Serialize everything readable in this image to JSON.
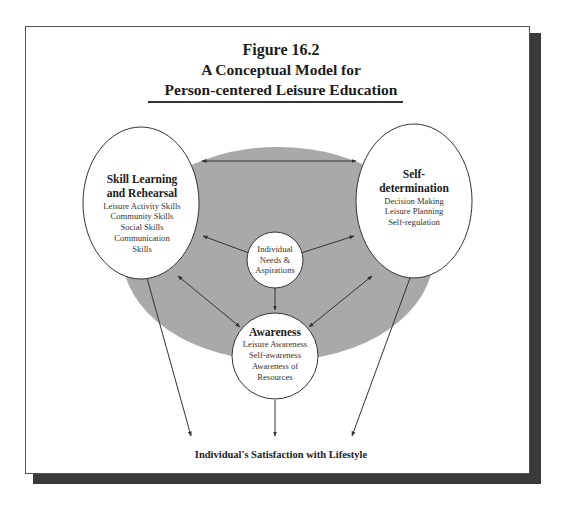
{
  "figure": {
    "label": "Figure 16.2",
    "title_line1": "A Conceptual Model for",
    "title_line2": "Person-centered Leisure Education"
  },
  "nodes": {
    "skill_learning": {
      "title_line1": "Skill Learning",
      "title_line2": "and Rehearsal",
      "items": [
        "Leisure Activity Skills",
        "Community Skills",
        "Social Skills",
        "Communication",
        "Skills"
      ]
    },
    "self_determination": {
      "title_line1": "Self-",
      "title_line2": "determination",
      "items": [
        "Decision Making",
        "Leisure Planning",
        "Self-regulation"
      ]
    },
    "center": {
      "lines": [
        "Individual",
        "Needs &",
        "Aspirations"
      ]
    },
    "awareness": {
      "title": "Awareness",
      "items": [
        "Leisure Awareness",
        "Self-awareness",
        "Awareness of",
        "Resources"
      ]
    }
  },
  "outcome": "Individual's Satisfaction with Lifestyle",
  "colors": {
    "background_ellipse": "#a9a9a9",
    "frame_shadow": "#3a3a3a",
    "stroke": "#333333"
  }
}
